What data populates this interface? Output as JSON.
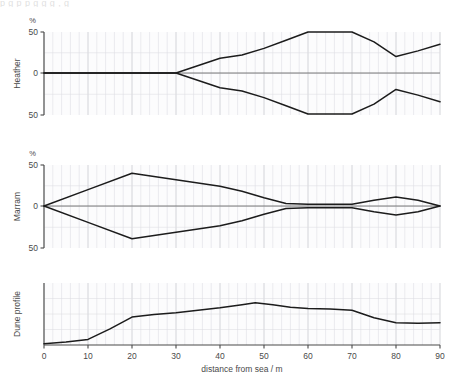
{
  "figure": {
    "top_bleed_text": "p    g        p   p   g        g    g  ,  g",
    "x_axis": {
      "title": "distance from sea / m",
      "unit": "m",
      "min": 0,
      "max": 90,
      "tick_labels": [
        "0",
        "10",
        "20",
        "30",
        "40",
        "50",
        "60",
        "70",
        "80",
        "90"
      ],
      "tick_values": [
        0,
        10,
        20,
        30,
        40,
        50,
        60,
        70,
        80,
        90
      ],
      "minor_step": 2,
      "major_step": 10
    },
    "panels": [
      {
        "id": "heather",
        "label": "Heather",
        "unit_label": "%",
        "y_tick_labels": [
          "50",
          "0",
          "50"
        ],
        "y_tick_values": [
          50,
          0,
          -50
        ],
        "y_min": -50,
        "y_max": 50
      },
      {
        "id": "marram",
        "label": "Marram",
        "unit_label": "%",
        "y_tick_labels": [
          "50",
          "0",
          "50"
        ],
        "y_tick_values": [
          50,
          0,
          -50
        ],
        "y_min": -50,
        "y_max": 50
      },
      {
        "id": "dune-profile",
        "label": "Dune profile",
        "unit_label": "",
        "y_tick_labels": [],
        "y_tick_values": [],
        "y_min": 0,
        "y_max": 100
      }
    ]
  },
  "chart_data": [
    {
      "type": "area",
      "id": "heather",
      "title": "Heather",
      "subtitle": "",
      "xlabel": "distance from sea / m",
      "ylabel": "Heather",
      "unit": "%",
      "plot_style": "kite-diagram",
      "note": "Percentage cover plotted symmetrically about zero (half-width each side).",
      "xlim": [
        0,
        90
      ],
      "ylim": [
        -50,
        50
      ],
      "grid": true,
      "legend": "none",
      "x": [
        0,
        10,
        20,
        30,
        40,
        45,
        50,
        55,
        60,
        70,
        75,
        80,
        85,
        90
      ],
      "values": [
        0,
        0,
        0,
        0,
        18,
        22,
        30,
        40,
        50,
        50,
        38,
        20,
        27,
        35
      ]
    },
    {
      "type": "area",
      "id": "marram",
      "title": "Marram",
      "subtitle": "",
      "xlabel": "distance from sea / m",
      "ylabel": "Marram",
      "unit": "%",
      "plot_style": "kite-diagram",
      "note": "Percentage cover plotted symmetrically about zero (half-width each side).",
      "xlim": [
        0,
        90
      ],
      "ylim": [
        -50,
        50
      ],
      "grid": true,
      "legend": "none",
      "x": [
        0,
        10,
        20,
        30,
        40,
        45,
        50,
        55,
        60,
        65,
        70,
        75,
        80,
        85,
        90
      ],
      "values": [
        0,
        20,
        40,
        32,
        24,
        18,
        10,
        3,
        2,
        2,
        2,
        7,
        11,
        7,
        0
      ]
    },
    {
      "type": "line",
      "id": "dune-profile",
      "title": "Dune profile",
      "subtitle": "",
      "xlabel": "distance from sea / m",
      "ylabel": "Dune profile",
      "unit": "",
      "plot_style": "elevation-profile",
      "note": "Relative dune height; vertical axis unscaled (no tick marks shown).",
      "xlim": [
        0,
        90
      ],
      "ylim": [
        0,
        100
      ],
      "grid": true,
      "legend": "none",
      "x": [
        0,
        5,
        10,
        15,
        20,
        25,
        30,
        35,
        40,
        45,
        48,
        52,
        56,
        60,
        65,
        70,
        75,
        80,
        85,
        90
      ],
      "values": [
        2,
        5,
        9,
        26,
        45,
        49,
        52,
        56,
        60,
        65,
        68,
        65,
        61,
        59,
        58,
        56,
        44,
        36,
        35,
        36
      ]
    }
  ]
}
